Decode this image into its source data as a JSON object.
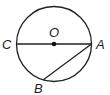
{
  "diagram": {
    "type": "circle-geometry",
    "labels": {
      "center": "O",
      "left": "C",
      "right": "A",
      "bottom": "B"
    },
    "segments": [
      "CA (diameter)",
      "AB (chord)"
    ],
    "colors": {
      "stroke": "#222222",
      "background": "#ffffff"
    }
  }
}
